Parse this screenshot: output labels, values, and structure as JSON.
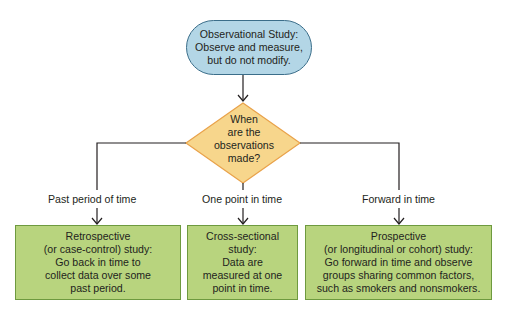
{
  "start": {
    "line1": "Observational Study:",
    "line2": "Observe and measure,",
    "line3": "but do not modify.",
    "fill_color": "#b3d6e6",
    "border_color": "#3b6e8a"
  },
  "decision": {
    "lines": [
      "When",
      "are the",
      "observations",
      "made?"
    ],
    "fill_color": "#f7d68c",
    "border_color": "#e9a24a"
  },
  "branches": [
    {
      "label": "Past period of time",
      "box": {
        "lines": [
          "Retrospective",
          "(or case-control) study:",
          "Go back in time to",
          "collect data over some",
          "past period."
        ]
      }
    },
    {
      "label": "One point in time",
      "box": {
        "lines": [
          "Cross-sectional",
          "study:",
          "Data are",
          "measured at one",
          "point in time."
        ]
      }
    },
    {
      "label": "Forward in time",
      "box": {
        "lines": [
          "Prospective",
          "(or longitudinal or cohort) study:",
          "Go forward in time and observe",
          "groups sharing common factors,",
          "such as smokers and nonsmokers."
        ]
      }
    }
  ],
  "colors": {
    "box_fill": "#b8d47e",
    "box_border": "#6e9a3f",
    "line": "#231f20"
  }
}
